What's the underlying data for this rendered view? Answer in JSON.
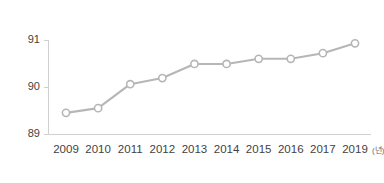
{
  "chart_data": {
    "type": "line",
    "title": "",
    "subtitle": "",
    "xlabel": "",
    "ylabel": "",
    "x_unit_label": "(년)",
    "categories": [
      "2009",
      "2010",
      "2011",
      "2012",
      "2013",
      "2014",
      "2015",
      "2016",
      "2017",
      "2019"
    ],
    "values": [
      89.45,
      89.55,
      90.06,
      90.19,
      90.49,
      90.49,
      90.6,
      90.6,
      90.72,
      90.93
    ],
    "series": [
      {
        "name": "",
        "values": [
          89.45,
          89.55,
          90.06,
          90.19,
          90.49,
          90.49,
          90.6,
          90.6,
          90.72,
          90.93
        ]
      }
    ],
    "ylim": [
      89,
      91
    ],
    "yticks": [
      "89",
      "90",
      "91"
    ],
    "ytick_values": [
      89,
      90,
      91
    ],
    "grid": false,
    "legend": "none",
    "marker": "open-circle",
    "line_color": "#b6b6b6",
    "marker_fill": "#ffffff",
    "marker_stroke": "#b6b6b6",
    "axis_color": "#d0d0d0",
    "tick_text_color": "#3f3f3f",
    "background": "#ffffff",
    "note": "x-axis is categorical; 2018 is omitted between 2017 and 2019"
  },
  "corner": {
    "mark": ""
  }
}
